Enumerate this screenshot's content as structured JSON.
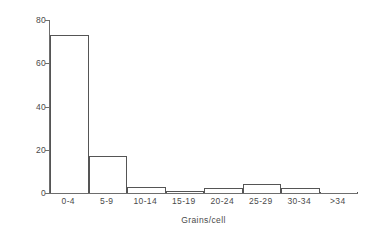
{
  "chart_data": {
    "type": "bar",
    "title": "",
    "subtitle": "",
    "xlabel": "Grains/cell",
    "ylabel": "% of total cells",
    "categories": [
      "0-4",
      "5-9",
      "10-14",
      "15-19",
      "20-24",
      "25-29",
      "30-34",
      ">34"
    ],
    "values": [
      73,
      17,
      3,
      1,
      2.5,
      4,
      2.5,
      0
    ],
    "series": [
      {
        "name": "% of total cells",
        "values": [
          73,
          17,
          3,
          1,
          2.5,
          4,
          2.5,
          0
        ]
      }
    ],
    "ylim": [
      0,
      80
    ],
    "yticks": [
      0,
      20,
      40,
      60,
      80
    ],
    "ytick_labels": [
      "0",
      "20",
      "40",
      "60",
      "80"
    ],
    "xlim": [
      0,
      8
    ],
    "grid": false,
    "legend": false,
    "legend_position": "none",
    "bar_style": "outline",
    "bar_color": "#ffffff",
    "bar_edge_color": "#555555",
    "axis_color": "#6d6d6d",
    "background_color": "#ffffff",
    "text_color": "#4a4a4a",
    "annotations": []
  }
}
